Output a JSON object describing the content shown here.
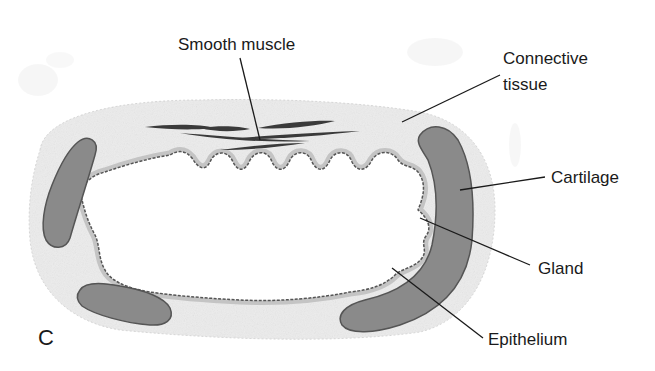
{
  "diagram": {
    "panel_letter": "C",
    "labels": {
      "smooth_muscle": "Smooth muscle",
      "connective_tissue_line1": "Connective",
      "connective_tissue_line2": "tissue",
      "cartilage": "Cartilage",
      "gland": "Gland",
      "epithelium": "Epithelium"
    },
    "colors": {
      "cartilage_fill": "#8a8a8a",
      "cartilage_stroke": "#555555",
      "connective_tissue": "#ececec",
      "epithelium_band": "#c4c4c4",
      "epithelium_line": "#555555",
      "muscle": "#3a3a3a",
      "leader_line": "#1a1a1a"
    }
  }
}
